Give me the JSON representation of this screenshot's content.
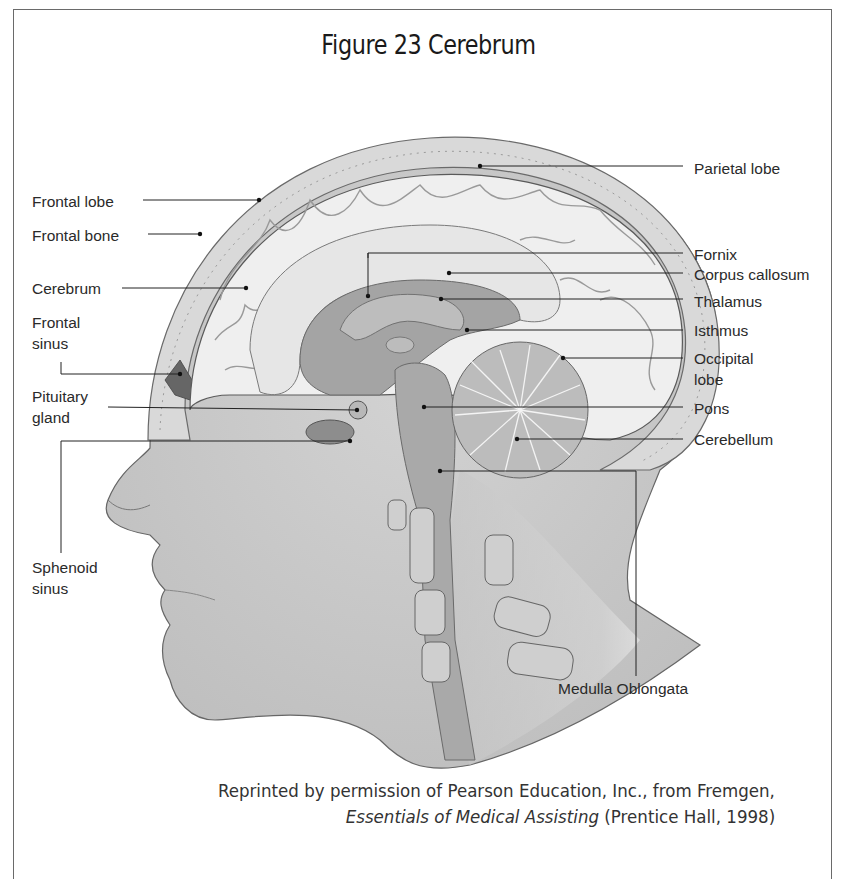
{
  "figure": {
    "title": "Figure 23  Cerebrum"
  },
  "labels": {
    "parietal_lobe": "Parietal lobe",
    "frontal_lobe": "Frontal lobe",
    "frontal_bone": "Frontal bone",
    "fornix": "Fornix",
    "cerebrum": "Cerebrum",
    "corpus_callosum": "Corpus callosum",
    "thalamus": "Thalamus",
    "frontal_sinus_1": "Frontal",
    "frontal_sinus_2": "sinus",
    "isthmus": "Isthmus",
    "occipital_lobe_1": "Occipital",
    "occipital_lobe_2": "lobe",
    "pituitary_gland_1": "Pituitary",
    "pituitary_gland_2": "gland",
    "pons": "Pons",
    "cerebellum": "Cerebellum",
    "sphenoid_sinus_1": "Sphenoid",
    "sphenoid_sinus_2": "sinus",
    "medulla_oblongata": "Medulla Oblongata"
  },
  "credit": {
    "line1": "Reprinted by permission of Pearson Education, Inc., from Fremgen,",
    "book_title": "Essentials of Medical Assisting",
    "line2_rest": " (Prentice Hall, 1998)"
  },
  "colors": {
    "skin": "#c9c9c9",
    "bone": "#d8d8d8",
    "brain": "#eeeeee",
    "deep_structures": "#9a9a9a",
    "outline": "#555555",
    "leader_line": "#222222"
  }
}
